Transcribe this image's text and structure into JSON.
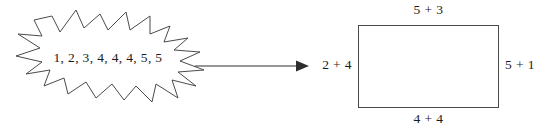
{
  "diagram": {
    "burst": {
      "values_text": "1, 2, 3, 4, 4, 4, 5, 5",
      "values": [
        1,
        2,
        3,
        4,
        4,
        4,
        5,
        5
      ]
    },
    "arrow": {
      "direction": "right"
    },
    "rectangle": {
      "labels": {
        "top": "5 + 3",
        "bottom": "4 + 4",
        "left": "2 + 4",
        "right": "5 + 1"
      }
    },
    "colors": {
      "background": "#ffffff",
      "stroke": "#4a4a4a",
      "text": "#1b1b1b"
    }
  }
}
